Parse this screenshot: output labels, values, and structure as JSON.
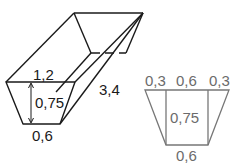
{
  "prism": {
    "labels": {
      "top_width": "1,2",
      "height": "0,75",
      "length": "3,4",
      "bottom_width": "0,6"
    },
    "line_color": "#1a1a1a"
  },
  "cross_section": {
    "labels": {
      "top_left": "0,3",
      "top_middle": "0,6",
      "top_right": "0,3",
      "height": "0,75",
      "bottom": "0,6"
    },
    "line_color": "#777777",
    "text_color": "#6b6b6b"
  }
}
